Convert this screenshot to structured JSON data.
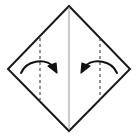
{
  "figure": {
    "title": "Origami fold step: fold left and right corners toward the vertical center crease",
    "type": "origami-instruction-diagram",
    "canvas": {
      "width": 137,
      "height": 137,
      "background": "#ffffff"
    }
  },
  "colors": {
    "outline": "#1a1a1a",
    "crease_center": "#9a9a9a",
    "fold_line_dashed": "#3a3a3a",
    "arrow": "#111111",
    "paper_fill": "#ffffff",
    "background": "#ffffff"
  },
  "shapes": {
    "paper": {
      "name": "square-rotated-45",
      "label": "diamond",
      "points": "69,6 130,69 69,131 8,69",
      "stroke_width": 2.0
    },
    "center_crease": {
      "name": "vertical-center-crease",
      "x": 69,
      "y_top": 7,
      "y_bottom": 130,
      "stroke_width": 1.0
    },
    "fold_lines": [
      {
        "name": "left-fold-line",
        "side": "left",
        "x": 40,
        "y_top": 38,
        "y_bottom": 100,
        "dash": "3,3",
        "stroke_width": 1.1
      },
      {
        "name": "right-fold-line",
        "side": "right",
        "x": 100,
        "y_top": 38,
        "y_bottom": 100,
        "dash": "3,3",
        "stroke_width": 1.1
      }
    ]
  },
  "arrows": [
    {
      "name": "left-fold-arrow",
      "direction": "rightward",
      "meaning": "fold left flap to the right onto the center crease",
      "path": "M 21,73 C 26,61 44,57 54,67",
      "head_points": "57,73 48,66 56,63",
      "stroke_width": 2.0
    },
    {
      "name": "right-fold-arrow",
      "direction": "leftward",
      "meaning": "fold right flap to the left onto the center crease",
      "path": "M 117,73 C 112,61 94,57 84,67",
      "head_points": "81,73 90,66 82,63",
      "stroke_width": 2.0
    }
  ],
  "labels": {
    "caption": "",
    "step_number": ""
  }
}
